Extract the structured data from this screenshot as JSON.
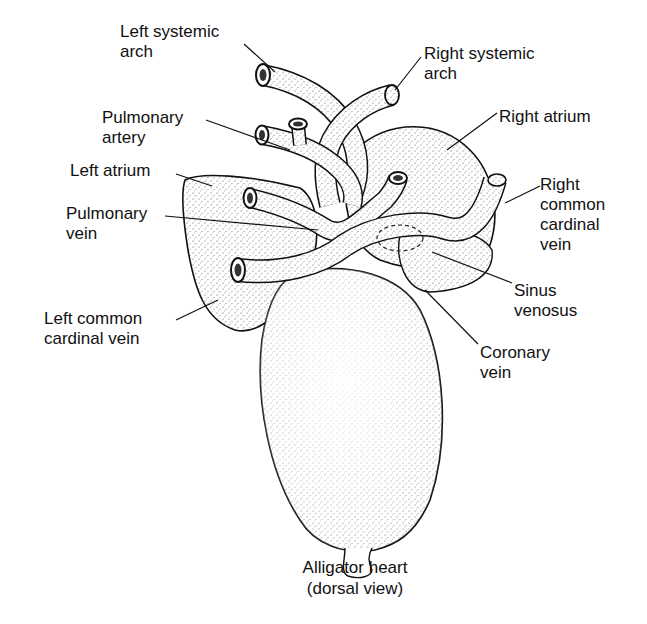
{
  "diagram": {
    "title": "Alligator heart",
    "subtitle": "(dorsal view)",
    "labels": {
      "left_systemic_arch": {
        "line1": "Left systemic",
        "line2": "arch"
      },
      "right_systemic_arch": {
        "line1": "Right systemic",
        "line2": "arch"
      },
      "pulmonary_artery": {
        "line1": "Pulmonary",
        "line2": "artery"
      },
      "right_atrium": {
        "line1": "Right atrium"
      },
      "left_atrium": {
        "line1": "Left atrium"
      },
      "pulmonary_vein": {
        "line1": "Pulmonary",
        "line2": "vein"
      },
      "right_common_cardinal_vein": {
        "line1": "Right",
        "line2": "common",
        "line3": "cardinal",
        "line4": "vein"
      },
      "sinus_venosus": {
        "line1": "Sinus",
        "line2": "venosus"
      },
      "left_common_cardinal_vein": {
        "line1": "Left common",
        "line2": "cardinal vein"
      },
      "coronary_vein": {
        "line1": "Coronary",
        "line2": "vein"
      }
    },
    "colors": {
      "ink": "#111111",
      "background": "#ffffff",
      "stipple": "#7a7a7a"
    }
  }
}
